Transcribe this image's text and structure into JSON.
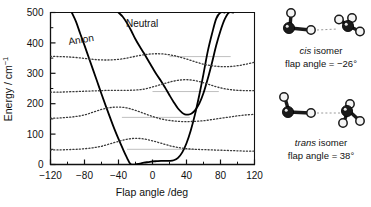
{
  "figure": {
    "axis": {
      "xlabel": "Flap angle /deg",
      "ylabel_main": "Energy / cm",
      "ylabel_sup": "−1",
      "xticks": [
        "−120",
        "−80",
        "−40",
        "0",
        "40",
        "80",
        "120"
      ],
      "yticks": [
        "0",
        "100",
        "200",
        "300",
        "400",
        "500"
      ]
    },
    "curve_labels": {
      "anion": "Anion",
      "neutral": "Neutral"
    },
    "molecules": [
      {
        "name": "cis-isomer",
        "title_italic": "cis",
        "title_rest": " isomer",
        "caption": "flap angle = −26°"
      },
      {
        "name": "trans-isomer",
        "title_italic": "trans",
        "title_rest": " isomer",
        "caption": "flap angle = 38°"
      }
    ]
  },
  "chart_data": {
    "type": "line",
    "title": "",
    "xlabel": "Flap angle /deg",
    "ylabel": "Energy / cm^-1",
    "xlim": [
      -120,
      120
    ],
    "ylim": [
      0,
      500
    ],
    "xticks": [
      -120,
      -80,
      -40,
      0,
      40,
      80,
      120
    ],
    "yticks": [
      0,
      100,
      200,
      300,
      400,
      500
    ],
    "xminor_step": 20,
    "grid": false,
    "legend": "inline-annotations",
    "annotations": [
      {
        "text": "Anion",
        "x": -62,
        "y": 432
      },
      {
        "text": "Neutral",
        "x": -2,
        "y": 478
      }
    ],
    "series": [
      {
        "name": "Anion",
        "style": "solid",
        "color": "#000000",
        "width": 1.8,
        "comment": "double-minimum-like potential, single deep minimum near -26 deg at 0 cm^-1, broad flat floor to +25 deg",
        "x": [
          -95,
          -90,
          -85,
          -80,
          -75,
          -70,
          -65,
          -60,
          -55,
          -50,
          -45,
          -40,
          -35,
          -30,
          -26,
          -20,
          -15,
          -10,
          -5,
          0,
          5,
          10,
          15,
          20,
          25,
          30,
          35,
          40,
          45,
          50,
          55,
          60,
          65,
          70,
          75,
          80,
          85
        ],
        "y": [
          500,
          470,
          430,
          392,
          352,
          312,
          272,
          232,
          193,
          155,
          118,
          84,
          52,
          22,
          2,
          0,
          3,
          6,
          8,
          10,
          11,
          12,
          12,
          12,
          14,
          22,
          40,
          70,
          112,
          165,
          228,
          298,
          372,
          430,
          480,
          500,
          500
        ]
      },
      {
        "name": "Neutral",
        "style": "solid",
        "color": "#000000",
        "width": 1.8,
        "comment": "minimum near +38 deg at about 165 cm^-1, steeply rising to both sides, shoulder near -20 deg",
        "x": [
          -40,
          -35,
          -30,
          -25,
          -20,
          -15,
          -10,
          -5,
          0,
          5,
          10,
          15,
          20,
          25,
          30,
          35,
          38,
          42,
          46,
          50,
          55,
          60,
          65,
          70,
          75,
          80,
          85,
          90,
          95
        ],
        "y": [
          500,
          486,
          465,
          440,
          412,
          388,
          366,
          342,
          318,
          295,
          275,
          252,
          228,
          205,
          184,
          170,
          165,
          164,
          168,
          178,
          200,
          235,
          282,
          335,
          392,
          440,
          478,
          500,
          500
        ]
      },
      {
        "name": "vibrational level v=0",
        "style": "dotted",
        "color": "#3a3a3a",
        "width": 1.3,
        "level": 50,
        "comment": "probability-density trace oscillating about the 50 cm^-1 level",
        "x": [
          -120,
          -110,
          -100,
          -90,
          -80,
          -70,
          -60,
          -50,
          -40,
          -30,
          -20,
          -10,
          0,
          10,
          20,
          30,
          40,
          50,
          60,
          70,
          80,
          90,
          100,
          110,
          120
        ],
        "y": [
          48,
          48,
          49,
          50,
          52,
          55,
          60,
          68,
          76,
          83,
          86,
          84,
          78,
          70,
          62,
          56,
          52,
          50,
          49,
          48,
          47,
          46,
          45,
          44,
          44
        ]
      },
      {
        "name": "vibrational level v=1",
        "style": "dotted",
        "color": "#3a3a3a",
        "width": 1.3,
        "level": 155,
        "comment": "trace oscillating about the 155 cm^-1 level",
        "x": [
          -120,
          -110,
          -100,
          -90,
          -80,
          -70,
          -60,
          -50,
          -40,
          -30,
          -20,
          -10,
          0,
          10,
          20,
          30,
          40,
          50,
          60,
          70,
          80,
          90,
          100,
          110,
          120
        ],
        "y": [
          152,
          153,
          155,
          158,
          163,
          172,
          181,
          187,
          189,
          186,
          178,
          168,
          158,
          150,
          145,
          142,
          141,
          142,
          144,
          148,
          152,
          156,
          160,
          163,
          165
        ]
      },
      {
        "name": "vibrational level v=2",
        "style": "dotted",
        "color": "#3a3a3a",
        "width": 1.3,
        "level": 240,
        "comment": "trace oscillating about the 240 cm^-1 level",
        "x": [
          -120,
          -110,
          -100,
          -90,
          -80,
          -70,
          -60,
          -50,
          -40,
          -30,
          -20,
          -10,
          0,
          10,
          20,
          30,
          40,
          50,
          60,
          70,
          80,
          90,
          100,
          110,
          120
        ],
        "y": [
          238,
          238,
          239,
          240,
          241,
          242,
          243,
          244,
          244,
          244,
          245,
          248,
          255,
          263,
          271,
          277,
          279,
          276,
          269,
          260,
          252,
          247,
          244,
          243,
          243
        ]
      },
      {
        "name": "vibrational level v=3",
        "style": "dotted",
        "color": "#3a3a3a",
        "width": 1.3,
        "level": 355,
        "comment": "trace oscillating about the 355 cm^-1 level",
        "x": [
          -120,
          -110,
          -100,
          -90,
          -80,
          -70,
          -60,
          -50,
          -40,
          -30,
          -20,
          -10,
          0,
          10,
          20,
          30,
          40,
          50,
          60,
          70,
          80,
          90,
          100,
          110,
          120
        ],
        "y": [
          356,
          355,
          354,
          352,
          349,
          346,
          344,
          344,
          346,
          350,
          356,
          361,
          364,
          364,
          361,
          355,
          347,
          338,
          330,
          325,
          322,
          322,
          325,
          330,
          336
        ]
      }
    ],
    "level_lines": [
      {
        "value": 50,
        "x_from": -30,
        "x_to": 50,
        "color": "#b9b9b9"
      },
      {
        "value": 155,
        "x_from": -36,
        "x_to": 44,
        "color": "#b9b9b9"
      },
      {
        "value": 240,
        "x_from": 0,
        "x_to": 78,
        "color": "#b9b9b9"
      },
      {
        "value": 355,
        "x_from": 20,
        "x_to": 92,
        "color": "#b9b9b9"
      }
    ]
  }
}
